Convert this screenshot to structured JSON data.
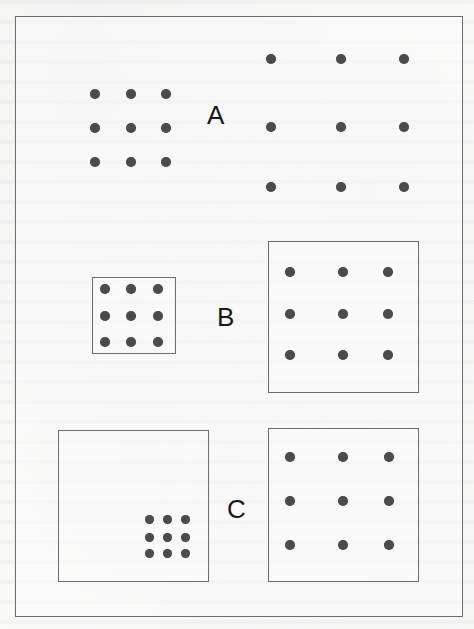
{
  "figure": {
    "dot_color": "#4b4b4e",
    "line_color": "#6b6b70",
    "background_color": "#fbfbfa",
    "label_color": "#18181a",
    "outer_frame": {
      "x": 15,
      "y": 16,
      "width": 448,
      "height": 601
    },
    "canvas": {
      "width": 474,
      "height": 629
    },
    "rows": [
      {
        "id": "row-a",
        "label": "A",
        "label_x": 207,
        "label_y": 102,
        "label_size": 26,
        "left": {
          "id": "a-left",
          "name": "small-spaced-dot-array",
          "box": null,
          "dot_diameter": 10,
          "columns_x": [
            95,
            131,
            166
          ],
          "rows_y": [
            94,
            128,
            162
          ]
        },
        "right": {
          "id": "a-right",
          "name": "wide-spaced-dot-array",
          "box": null,
          "dot_diameter": 10,
          "columns_x": [
            271,
            341,
            404
          ],
          "rows_y": [
            59,
            127,
            187
          ]
        }
      },
      {
        "id": "row-b",
        "label": "B",
        "label_x": 217,
        "label_y": 304,
        "label_size": 26,
        "left": {
          "id": "b-left",
          "name": "small-framed-dot-array",
          "box": {
            "x": 92,
            "y": 277,
            "width": 84,
            "height": 77
          },
          "dot_diameter": 10,
          "columns_x": [
            105,
            131,
            158
          ],
          "rows_y": [
            289,
            316,
            342
          ]
        },
        "right": {
          "id": "b-right",
          "name": "large-framed-dot-array",
          "box": {
            "x": 268,
            "y": 241,
            "width": 151,
            "height": 152
          },
          "dot_diameter": 10,
          "columns_x": [
            290,
            343,
            388
          ],
          "rows_y": [
            272,
            314,
            355
          ]
        }
      },
      {
        "id": "row-c",
        "label": "C",
        "label_x": 227,
        "label_y": 496,
        "label_size": 26,
        "left": {
          "id": "c-left",
          "name": "large-frame-with-small-corner-array",
          "box": {
            "x": 58,
            "y": 430,
            "width": 151,
            "height": 152
          },
          "dot_diameter": 9,
          "columns_x": [
            149,
            167,
            185
          ],
          "rows_y": [
            519,
            537,
            553
          ]
        },
        "right": {
          "id": "c-right",
          "name": "large-frame-with-spread-array",
          "box": {
            "x": 268,
            "y": 428,
            "width": 151,
            "height": 154
          },
          "dot_diameter": 10,
          "columns_x": [
            290,
            343,
            389
          ],
          "rows_y": [
            457,
            501,
            545
          ]
        }
      }
    ]
  }
}
